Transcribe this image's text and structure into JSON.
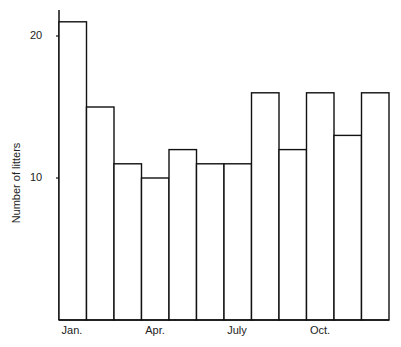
{
  "chart_data": {
    "type": "bar",
    "title": "",
    "xlabel": "",
    "ylabel": "Number of litters",
    "categories": [
      "Jan.",
      "Feb.",
      "Mar.",
      "Apr.",
      "May",
      "June",
      "July",
      "Aug.",
      "Sept.",
      "Oct.",
      "Nov.",
      "Dec."
    ],
    "values": [
      21,
      15,
      11,
      10,
      12,
      11,
      11,
      16,
      12,
      16,
      13,
      16
    ],
    "ylim": [
      0,
      22.5
    ],
    "yticks": [
      10,
      20
    ],
    "ytick_labels": [
      "10",
      "20"
    ],
    "xtick_labels_shown": [
      {
        "index": 0,
        "label": "Jan."
      },
      {
        "index": 3,
        "label": "Apr."
      },
      {
        "index": 6,
        "label": "July"
      },
      {
        "index": 9,
        "label": "Oct."
      }
    ],
    "grid": false,
    "legend": null,
    "style": {
      "fill": "#ffffff",
      "stroke": "#111111"
    }
  },
  "axis": {
    "ylabel": "Number of litters",
    "ytick_10": "10",
    "ytick_20": "20",
    "xtick_jan": "Jan.",
    "xtick_apr": "Apr.",
    "xtick_jul": "July",
    "xtick_oct": "Oct."
  }
}
